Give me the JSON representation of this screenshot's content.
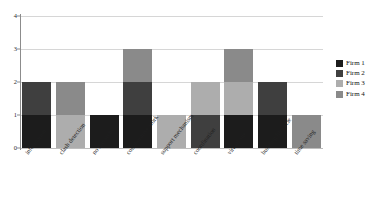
{
  "chart_data": {
    "type": "bar",
    "subtype": "stacked-bar",
    "title": "",
    "xlabel": "",
    "ylabel": "",
    "ylim": [
      0,
      4
    ],
    "yticks": [
      0,
      1,
      2,
      3,
      4
    ],
    "grid": true,
    "legend_position": "right",
    "categories": [
      "information",
      "clash detection",
      "no hierarchy",
      "collaborative work",
      "support mechanism",
      "coordination",
      "virtual site",
      "building lifecycle",
      "time saving"
    ],
    "series": [
      {
        "name": "Firm 1",
        "color": "#1c1c1c",
        "values": [
          1,
          0,
          1,
          1,
          0,
          0,
          1,
          1,
          0
        ]
      },
      {
        "name": "Firm 2",
        "color": "#3f3f3f",
        "values": [
          1,
          0,
          0,
          1,
          0,
          1,
          0,
          1,
          0
        ]
      },
      {
        "name": "Firm 3",
        "color": "#adadad",
        "values": [
          0,
          1,
          0,
          0,
          1,
          1,
          1,
          0,
          0
        ]
      },
      {
        "name": "Firm 4",
        "color": "#8a8a8a",
        "values": [
          0,
          1,
          0,
          1,
          0,
          0,
          1,
          0,
          1
        ]
      }
    ],
    "totals": [
      2,
      2,
      1,
      3,
      1,
      2,
      3,
      2,
      1
    ]
  },
  "legend": {
    "entries": [
      {
        "label": "Firm 1",
        "color": "#1c1c1c"
      },
      {
        "label": "Firm 2",
        "color": "#3f3f3f"
      },
      {
        "label": "Firm 3",
        "color": "#adadad"
      },
      {
        "label": "Firm 4",
        "color": "#8a8a8a"
      }
    ]
  },
  "axis": {
    "y_tick_labels": [
      "0",
      "1",
      "2",
      "3",
      "4"
    ]
  },
  "colors": {
    "background": "#ffffff",
    "gridline": "#d6d6d6",
    "axis": "#8c8c8c",
    "text": "#1a1a1a"
  }
}
